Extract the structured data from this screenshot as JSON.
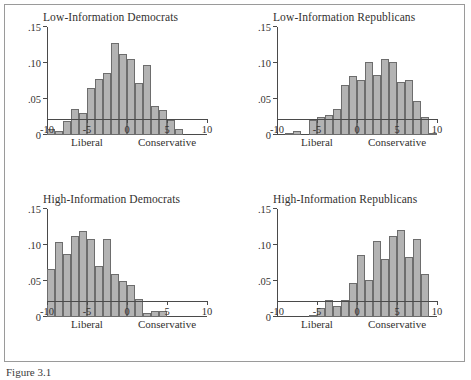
{
  "figure": {
    "caption": "Figure 3.1",
    "axis": {
      "ylabels": [
        ".15",
        ".10",
        ".05",
        "0"
      ],
      "yvalues": [
        0.15,
        0.1,
        0.05,
        0
      ],
      "ylim": [
        0,
        0.15
      ],
      "xlabels": [
        "-10",
        "-5",
        "0",
        "5",
        "10"
      ],
      "xvalues": [
        -10,
        -5,
        0,
        5,
        10
      ],
      "xlim": [
        -10,
        10
      ],
      "left_direction_label": "Liberal",
      "right_direction_label": "Conservative",
      "left_direction_at": -5,
      "right_direction_at": 5
    },
    "style": {
      "bar_fill": "#b3b3b3",
      "bar_stroke": "#6d6d6d",
      "axis_color": "#4a4a4a",
      "frame_color": "#9a9a9a",
      "text_color": "#33312f",
      "background": "#ffffff"
    }
  },
  "chart_data": [
    {
      "type": "bar",
      "title": "Low-Information Democrats",
      "xlabel": "",
      "ylabel": "",
      "xlim": [
        -10,
        10
      ],
      "ylim": [
        0,
        0.15
      ],
      "grid": false,
      "legend": "none",
      "bin_width": 1,
      "categories": [
        -9.5,
        -8.5,
        -7.5,
        -6.5,
        -5.5,
        -4.5,
        -3.5,
        -2.5,
        -1.5,
        -0.5,
        0.5,
        1.5,
        2.5,
        3.5,
        4.5,
        5.5,
        6.5
      ],
      "values": [
        0.008,
        0.006,
        0.02,
        0.036,
        0.03,
        0.065,
        0.078,
        0.086,
        0.128,
        0.113,
        0.106,
        0.072,
        0.097,
        0.04,
        0.035,
        0.021,
        0.008,
        0.005
      ]
    },
    {
      "type": "bar",
      "title": "Low-Information Republicans",
      "xlabel": "",
      "ylabel": "",
      "xlim": [
        -10,
        10
      ],
      "ylim": [
        0,
        0.15
      ],
      "grid": false,
      "legend": "none",
      "bin_width": 1,
      "categories": [
        -8.5,
        -7.5,
        -5.5,
        -4.5,
        -3.5,
        -2.5,
        -1.5,
        -0.5,
        0.5,
        1.5,
        2.5,
        3.5,
        4.5,
        5.5,
        6.5,
        7.5,
        8.5,
        9.5
      ],
      "values": [
        0.003,
        0.005,
        0.021,
        0.025,
        0.028,
        0.036,
        0.07,
        0.082,
        0.076,
        0.102,
        0.083,
        0.106,
        0.101,
        0.073,
        0.077,
        0.047,
        0.025,
        0.003
      ]
    },
    {
      "type": "bar",
      "title": "High-Information Democrats",
      "xlabel": "",
      "ylabel": "",
      "xlim": [
        -10,
        10
      ],
      "ylim": [
        0,
        0.15
      ],
      "grid": false,
      "legend": "none",
      "bin_width": 1,
      "categories": [
        -9.5,
        -8.5,
        -7.5,
        -6.5,
        -5.5,
        -4.5,
        -3.5,
        -2.5,
        -1.5,
        -0.5,
        0.5,
        1.5,
        2.5,
        3.5,
        4.5
      ],
      "values": [
        0.067,
        0.104,
        0.088,
        0.113,
        0.119,
        0.108,
        0.071,
        0.108,
        0.06,
        0.05,
        0.045,
        0.025,
        0.005,
        0.009,
        0.008,
        0.003
      ]
    },
    {
      "type": "bar",
      "title": "High-Information Republicans",
      "xlabel": "",
      "ylabel": "",
      "xlim": [
        -10,
        10
      ],
      "ylim": [
        0,
        0.15
      ],
      "grid": false,
      "legend": "none",
      "bin_width": 1,
      "categories": [
        -5.5,
        -4.5,
        -3.5,
        -2.5,
        -1.5,
        -0.5,
        0.5,
        1.5,
        2.5,
        3.5,
        4.5,
        5.5,
        6.5,
        7.5,
        8.5
      ],
      "values": [
        0.003,
        0.012,
        0.023,
        0.015,
        0.023,
        0.047,
        0.086,
        0.051,
        0.105,
        0.081,
        0.112,
        0.121,
        0.084,
        0.109,
        0.06,
        0.037,
        0.009
      ]
    }
  ]
}
